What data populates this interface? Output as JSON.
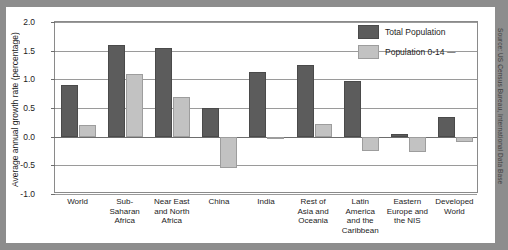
{
  "chart_data": {
    "type": "bar",
    "title": "",
    "xlabel": "",
    "ylabel": "Average annual growth rate (percentage)",
    "ylim": [
      -1.0,
      2.0
    ],
    "yticks": [
      "2.0",
      "1.5",
      "1.0",
      "0.5",
      "0.0",
      "-0.5",
      "-1.0"
    ],
    "ytick_values": [
      2.0,
      1.5,
      1.0,
      0.5,
      0.0,
      -0.5,
      -1.0
    ],
    "grid": true,
    "legend_position": "top-right",
    "categories": [
      "World",
      "Sub-\nSaharan\nAfrica",
      "Near East\nand North\nAfrica",
      "China",
      "India",
      "Rest of\nAsia and\nOceania",
      "Latin\nAmerica\nand the\nCaribbean",
      "Eastern\nEurope and\nthe NIS",
      "Developed\nWorld"
    ],
    "series": [
      {
        "name": "Total Population",
        "color": "#5c5c5c",
        "values": [
          0.9,
          1.6,
          1.55,
          0.5,
          1.13,
          1.25,
          0.97,
          0.05,
          0.35
        ]
      },
      {
        "name": "Population 0-14",
        "color": "#c2c2c2",
        "values": [
          0.2,
          1.1,
          0.7,
          -0.55,
          -0.04,
          0.22,
          -0.25,
          -0.27,
          -0.1
        ]
      }
    ]
  },
  "legend": {
    "items": [
      {
        "label": "Total Population"
      },
      {
        "label": "Population 0-14 —"
      }
    ]
  },
  "source": {
    "credit": "Source: US Census Bureau, International Data Base"
  }
}
